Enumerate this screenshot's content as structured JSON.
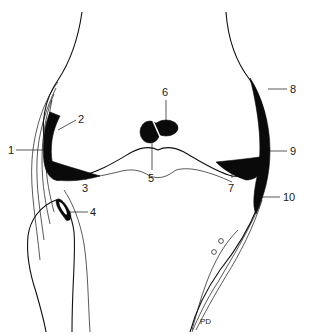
{
  "diagram": {
    "colors": {
      "ink": "#111111",
      "background": "#ffffff"
    },
    "labels": [
      {
        "id": "1",
        "text": "1",
        "x": 8,
        "y": 153
      },
      {
        "id": "2",
        "text": "2",
        "x": 78,
        "y": 123
      },
      {
        "id": "3",
        "text": "3",
        "x": 84,
        "y": 191
      },
      {
        "id": "4",
        "text": "4",
        "x": 90,
        "y": 216
      },
      {
        "id": "5",
        "text": "5",
        "x": 148,
        "y": 182
      },
      {
        "id": "6",
        "text": "6",
        "x": 162,
        "y": 95
      },
      {
        "id": "7",
        "text": "7",
        "x": 228,
        "y": 191
      },
      {
        "id": "8",
        "text": "8",
        "x": 290,
        "y": 93
      },
      {
        "id": "9",
        "text": "9",
        "x": 290,
        "y": 155
      },
      {
        "id": "10",
        "text": "10",
        "x": 283,
        "y": 200
      }
    ],
    "signature": "PD"
  }
}
